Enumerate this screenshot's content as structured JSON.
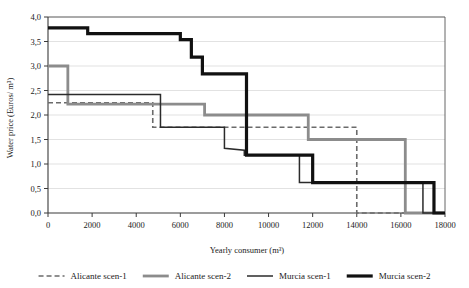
{
  "chart_data": {
    "type": "line",
    "subtype": "step",
    "title": "",
    "xlabel": "Yearly consumer (m³)",
    "ylabel": "Water price (Euros/ m³)",
    "xlim": [
      0,
      18000
    ],
    "ylim": [
      0,
      4.0
    ],
    "xticks": [
      0,
      2000,
      4000,
      6000,
      8000,
      10000,
      12000,
      14000,
      16000,
      18000
    ],
    "xtick_labels": [
      "0",
      "2000",
      "4000",
      "6000",
      "8000",
      "10000",
      "12000",
      "14000",
      "16000",
      "18000"
    ],
    "yticks": [
      0,
      0.5,
      1.0,
      1.5,
      2.0,
      2.5,
      3.0,
      3.5,
      4.0
    ],
    "ytick_labels": [
      "0,0",
      "0,5",
      "1,0",
      "1,5",
      "2,0",
      "2,5",
      "3,0",
      "3,5",
      "4,0"
    ],
    "grid": "horizontal",
    "legend_position": "bottom",
    "series": [
      {
        "name": "Alicante scen-1",
        "color": "#6b6b6b",
        "width": 1.6,
        "dash": "5,3",
        "points": [
          [
            0,
            2.25
          ],
          [
            4750,
            2.25
          ],
          [
            4750,
            1.75
          ],
          [
            14000,
            1.75
          ],
          [
            14000,
            0.0
          ],
          [
            18000,
            0.0
          ]
        ]
      },
      {
        "name": "Alicante scen-2",
        "color": "#8c8c8c",
        "width": 2.8,
        "dash": "none",
        "points": [
          [
            0,
            3.0
          ],
          [
            900,
            3.0
          ],
          [
            900,
            2.22
          ],
          [
            7100,
            2.22
          ],
          [
            7100,
            2.0
          ],
          [
            11800,
            2.0
          ],
          [
            11800,
            1.5
          ],
          [
            16200,
            1.5
          ],
          [
            16200,
            0.0
          ],
          [
            18000,
            0.0
          ]
        ]
      },
      {
        "name": "Murcia scen-1",
        "color": "#2b2b2b",
        "width": 1.5,
        "dash": "none",
        "points": [
          [
            0,
            2.42
          ],
          [
            5100,
            2.42
          ],
          [
            5100,
            1.75
          ],
          [
            8000,
            1.75
          ],
          [
            8000,
            1.32
          ],
          [
            8900,
            1.28
          ],
          [
            8900,
            1.18
          ],
          [
            11400,
            1.18
          ],
          [
            11400,
            0.62
          ],
          [
            17000,
            0.62
          ],
          [
            17000,
            0.0
          ],
          [
            18000,
            0.0
          ]
        ]
      },
      {
        "name": "Murcia scen-2",
        "color": "#111111",
        "width": 3.2,
        "dash": "none",
        "points": [
          [
            0,
            3.78
          ],
          [
            1800,
            3.78
          ],
          [
            1800,
            3.66
          ],
          [
            6000,
            3.66
          ],
          [
            6000,
            3.54
          ],
          [
            6500,
            3.54
          ],
          [
            6500,
            3.18
          ],
          [
            7000,
            3.18
          ],
          [
            7000,
            2.84
          ],
          [
            9000,
            2.84
          ],
          [
            9000,
            1.18
          ],
          [
            12000,
            1.18
          ],
          [
            12000,
            0.62
          ],
          [
            17500,
            0.62
          ],
          [
            17500,
            0.0
          ],
          [
            18000,
            0.0
          ]
        ]
      }
    ]
  },
  "legend": {
    "items": [
      {
        "label": "Alicante scen-1"
      },
      {
        "label": "Alicante scen-2"
      },
      {
        "label": "Murcia scen-1"
      },
      {
        "label": "Murcia scen-2"
      }
    ]
  }
}
